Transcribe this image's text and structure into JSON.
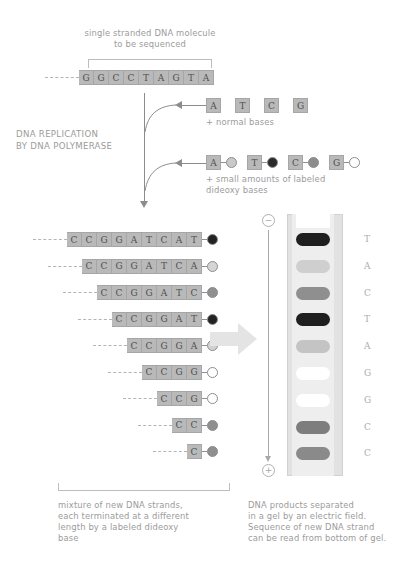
{
  "title": {
    "top_label": "single stranded DNA molecule\nto be sequenced"
  },
  "template_strand": {
    "bases": [
      "G",
      "G",
      "C",
      "C",
      "T",
      "A",
      "G",
      "T",
      "A"
    ]
  },
  "process_label": "DNA REPLICATION\nBY DNA POLYMERASE",
  "normal_bases": {
    "bases": [
      "A",
      "T",
      "C",
      "G"
    ],
    "caption": "+ normal bases"
  },
  "dideoxy_bases": {
    "caption": "+ small amounts of labeled\ndideoxy bases",
    "items": [
      {
        "letter": "A",
        "color": "#c9c9c9"
      },
      {
        "letter": "T",
        "color": "#2b2b2b"
      },
      {
        "letter": "C",
        "color": "#8d8d8d"
      },
      {
        "letter": "G",
        "color": "#ffffff"
      }
    ]
  },
  "new_strands": [
    {
      "bases": [
        "C",
        "C",
        "G",
        "G",
        "A",
        "T",
        "C",
        "A",
        "T"
      ],
      "terminator_color": "#232323"
    },
    {
      "bases": [
        "C",
        "C",
        "G",
        "G",
        "A",
        "T",
        "C",
        "A"
      ],
      "terminator_color": "#d5d5d5"
    },
    {
      "bases": [
        "C",
        "C",
        "G",
        "G",
        "A",
        "T",
        "C"
      ],
      "terminator_color": "#8f8f8f"
    },
    {
      "bases": [
        "C",
        "C",
        "G",
        "G",
        "A",
        "T"
      ],
      "terminator_color": "#232323"
    },
    {
      "bases": [
        "C",
        "C",
        "G",
        "G",
        "A"
      ],
      "terminator_color": "#d1d1d1"
    },
    {
      "bases": [
        "C",
        "C",
        "G",
        "G"
      ],
      "terminator_color": "#ffffff"
    },
    {
      "bases": [
        "C",
        "C",
        "G"
      ],
      "terminator_color": "#ffffff"
    },
    {
      "bases": [
        "C",
        "C"
      ],
      "terminator_color": "#8f8f8f"
    },
    {
      "bases": [
        "C"
      ],
      "terminator_color": "#8f8f8f"
    }
  ],
  "gel": {
    "electrode_top": "−",
    "electrode_bottom": "+",
    "bands": [
      {
        "letter": "T",
        "color": "#1f1f1f"
      },
      {
        "letter": "A",
        "color": "#cfcfcf"
      },
      {
        "letter": "C",
        "color": "#8f8f8f"
      },
      {
        "letter": "T",
        "color": "#1f1f1f"
      },
      {
        "letter": "A",
        "color": "#c4c4c4"
      },
      {
        "letter": "G",
        "color": "#ffffff"
      },
      {
        "letter": "G",
        "color": "#ffffff"
      },
      {
        "letter": "C",
        "color": "#7d7d7d"
      },
      {
        "letter": "C",
        "color": "#8a8a8a"
      }
    ]
  },
  "captions": {
    "left": "mixture of new DNA strands,\neach terminated at a different\nlength by a labeled dideoxy\nbase",
    "right": "DNA products separated\nin a gel by an electric field.\nSequence of new DNA strand\ncan be read from bottom of gel."
  },
  "colors": {
    "base_box": "#b9b9b9",
    "ink": "#9b9b9b",
    "gel_body": "#eeeeee",
    "gel_edge": "#d2d2d2"
  }
}
